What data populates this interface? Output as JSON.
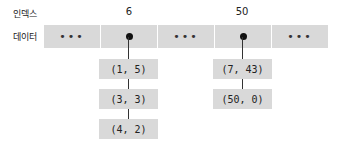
{
  "labels": {
    "index": "인덱스",
    "data": "데이터"
  },
  "indices": [
    "6",
    "50"
  ],
  "cells": [
    "•••",
    "",
    "•••",
    "",
    "•••"
  ],
  "chains": [
    {
      "index": "6",
      "nodes": [
        "(1, 5)",
        "(3, 3)",
        "(4, 2)"
      ]
    },
    {
      "index": "50",
      "nodes": [
        "(7, 43)",
        "(50, 0)"
      ]
    }
  ],
  "colors": {
    "cell": "#d9d9d9",
    "line": "#333333",
    "dot": "#111111"
  }
}
